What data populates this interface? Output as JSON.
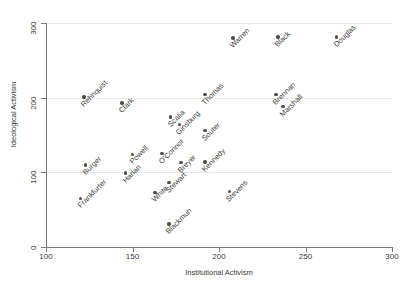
{
  "chart_data": {
    "type": "scatter",
    "title": "",
    "xlabel": "Institutional Activism",
    "ylabel": "Ideological Activism",
    "xlim": [
      100,
      300
    ],
    "ylim": [
      0,
      300
    ],
    "xticks": [
      100,
      150,
      200,
      250,
      300
    ],
    "yticks": [
      0,
      100,
      200,
      300
    ],
    "grid": "horizontal",
    "legend": "none",
    "point_color": "#4d4d4d",
    "grid_color": "#e8e8e8",
    "axis_color": "#7a7a7a",
    "points": [
      {
        "label": "Frankfurter",
        "x": 120,
        "y": 65
      },
      {
        "label": "Burger",
        "x": 123,
        "y": 110
      },
      {
        "label": "Rehnquist",
        "x": 122,
        "y": 201
      },
      {
        "label": "Clark",
        "x": 144,
        "y": 193
      },
      {
        "label": "Harlan",
        "x": 146,
        "y": 99
      },
      {
        "label": "Powell",
        "x": 150,
        "y": 124
      },
      {
        "label": "White",
        "x": 163,
        "y": 73
      },
      {
        "label": "O'Connor",
        "x": 167,
        "y": 125
      },
      {
        "label": "Stewart",
        "x": 171,
        "y": 86
      },
      {
        "label": "Blackmun",
        "x": 171,
        "y": 31
      },
      {
        "label": "Scalia",
        "x": 172,
        "y": 174
      },
      {
        "label": "Ginsburg",
        "x": 177,
        "y": 164
      },
      {
        "label": "Breyer",
        "x": 178,
        "y": 113
      },
      {
        "label": "Thomas",
        "x": 192,
        "y": 204
      },
      {
        "label": "Souter",
        "x": 192,
        "y": 156
      },
      {
        "label": "Kennedy",
        "x": 192,
        "y": 114
      },
      {
        "label": "Stevens",
        "x": 206,
        "y": 74
      },
      {
        "label": "Warren",
        "x": 208,
        "y": 280
      },
      {
        "label": "Black",
        "x": 234,
        "y": 281
      },
      {
        "label": "Brennan",
        "x": 233,
        "y": 204
      },
      {
        "label": "Marshall",
        "x": 237,
        "y": 188
      },
      {
        "label": "Douglas",
        "x": 268,
        "y": 281
      }
    ]
  }
}
